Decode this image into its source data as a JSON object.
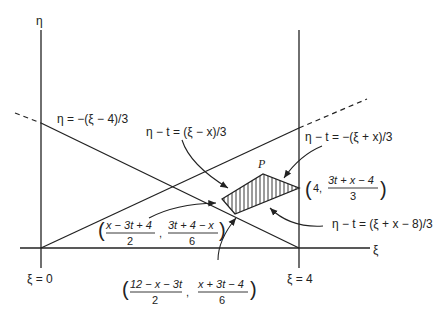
{
  "figure": {
    "axes": {
      "vertical_label": "η",
      "horizontal_label": "ξ",
      "left_line_label": "ξ = 0",
      "right_line_label": "ξ = 4"
    },
    "line_labels": {
      "descending": "η = −(ξ − 4)/3",
      "upper_left_edge": "η − t = (ξ − x)/3",
      "upper_right_edge": "η − t = −(ξ + x)/3",
      "lower_right_edge": "η − t = (ξ + x − 8)/3"
    },
    "point_label": "P",
    "vertices": {
      "left": {
        "num1": "x − 3t + 4",
        "den1": "2",
        "num2": "3t + 4 − x",
        "den2": "6"
      },
      "bottom": {
        "num1": "12 − x − 3t",
        "den1": "2",
        "num2": "x + 3t − 4",
        "den2": "6"
      },
      "right": {
        "first": "4,",
        "num2": "3t + x − 4",
        "den2": "3"
      }
    },
    "colors": {
      "ink": "#222222",
      "background": "#ffffff"
    }
  }
}
